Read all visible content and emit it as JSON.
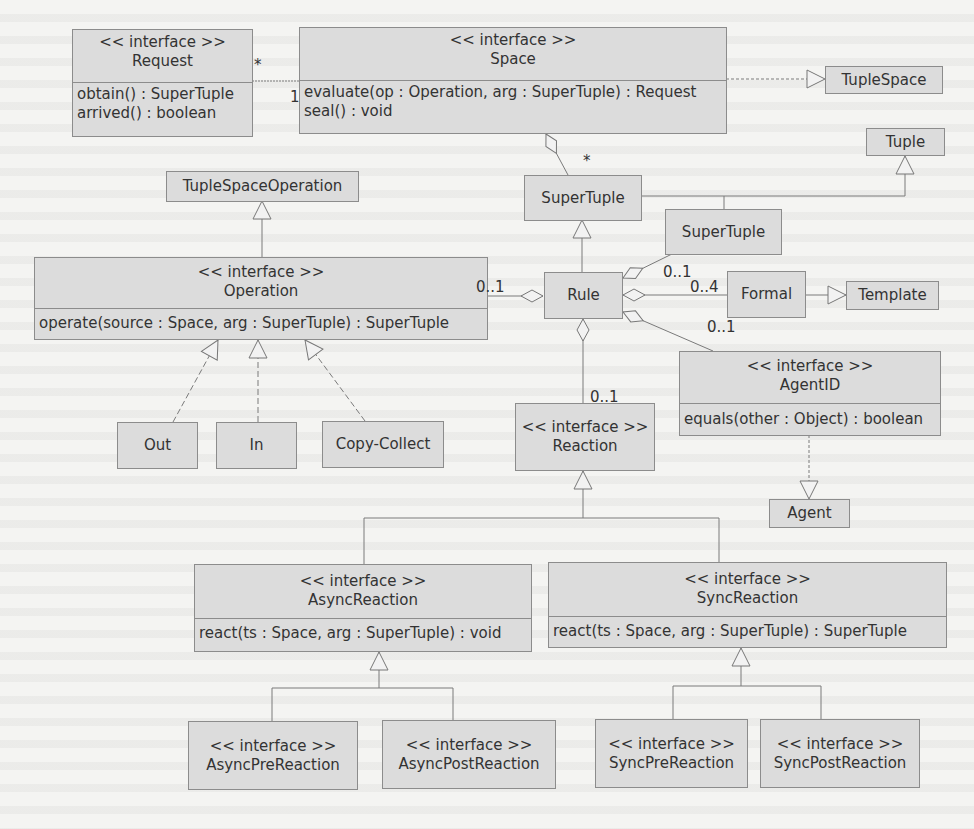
{
  "diagram": {
    "type": "UML class diagram",
    "stereotype": "<< interface >>",
    "classes": {
      "request": {
        "name": "Request",
        "stereotype": "<< interface >>",
        "methods": [
          "obtain() : SuperTuple",
          "arrived() : boolean"
        ]
      },
      "space": {
        "name": "Space",
        "stereotype": "<< interface >>",
        "methods": [
          "evaluate(op : Operation, arg : SuperTuple) : Request",
          "seal() : void"
        ]
      },
      "tuplespace": {
        "name": "TupleSpace"
      },
      "tuple": {
        "name": "Tuple"
      },
      "tuplespaceoperation": {
        "name": "TupleSpaceOperation"
      },
      "supertuple": {
        "name": "SuperTuple"
      },
      "supertuple2": {
        "name": "SuperTuple"
      },
      "operation": {
        "name": "Operation",
        "stereotype": "<< interface >>",
        "methods": [
          "operate(source : Space, arg : SuperTuple) : SuperTuple"
        ]
      },
      "rule": {
        "name": "Rule"
      },
      "formal": {
        "name": "Formal"
      },
      "template": {
        "name": "Template"
      },
      "agentid": {
        "name": "AgentID",
        "stereotype": "<< interface >>",
        "methods": [
          "equals(other : Object) : boolean"
        ]
      },
      "reaction": {
        "name": "Reaction",
        "stereotype": "<< interface >>"
      },
      "out": {
        "name": "Out"
      },
      "in": {
        "name": "In"
      },
      "copycollect": {
        "name": "Copy-Collect"
      },
      "agent": {
        "name": "Agent"
      },
      "asyncreaction": {
        "name": "AsyncReaction",
        "stereotype": "<< interface >>",
        "methods": [
          "react(ts : Space, arg : SuperTuple) : void"
        ]
      },
      "syncreaction": {
        "name": "SyncReaction",
        "stereotype": "<< interface >>",
        "methods": [
          "react(ts : Space, arg : SuperTuple) : SuperTuple"
        ]
      },
      "asyncprereaction": {
        "name": "AsyncPreReaction",
        "stereotype": "<< interface >>"
      },
      "asyncpostreaction": {
        "name": "AsyncPostReaction",
        "stereotype": "<< interface >>"
      },
      "syncprereaction": {
        "name": "SyncPreReaction",
        "stereotype": "<< interface >>"
      },
      "syncpostreaction": {
        "name": "SyncPostReaction",
        "stereotype": "<< interface >>"
      }
    },
    "multiplicities": {
      "request_space_many": "*",
      "request_space_one": "1",
      "space_supertuple": "*",
      "operation_rule": "0..1",
      "rule_supertuple": "0..1",
      "rule_formal": "0..4",
      "rule_agentid": "0..1",
      "rule_reaction": "0..1"
    }
  },
  "colors": {
    "box_fill": "#dcdcdc",
    "box_border": "#8c8c8c",
    "line": "#7a7a7a",
    "background": "#f4f4f2"
  }
}
